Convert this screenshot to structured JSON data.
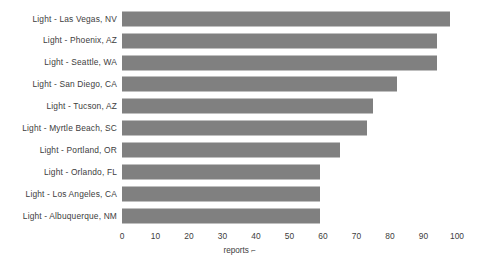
{
  "chart_data": {
    "type": "bar",
    "orientation": "horizontal",
    "title": "",
    "xlabel": "reports",
    "ylabel": "",
    "xlim": [
      0,
      100
    ],
    "grid": false,
    "legend": false,
    "bar_color": "#808080",
    "text_color": "#3d3d3d",
    "background_color": "#ffffff",
    "xticks": [
      0,
      10,
      20,
      30,
      40,
      50,
      60,
      70,
      80,
      90,
      100
    ],
    "xtick_labels": [
      "0",
      "10",
      "20",
      "30",
      "40",
      "50",
      "60",
      "70",
      "80",
      "90",
      "100"
    ],
    "categories": [
      "Light - Las Vegas, NV",
      "Light - Phoenix, AZ",
      "Light - Seattle, WA",
      "Light - San Diego, CA",
      "Light - Tucson, AZ",
      "Light - Myrtle Beach, SC",
      "Light - Portland, OR",
      "Light - Orlando, FL",
      "Light - Los Angeles, CA",
      "Light - Albuquerque, NM"
    ],
    "values": [
      98,
      94,
      94,
      82,
      75,
      73,
      65,
      59,
      59,
      59
    ]
  },
  "axis": {
    "x_title_text": "reports",
    "x_sort_glyph": "⌐"
  }
}
